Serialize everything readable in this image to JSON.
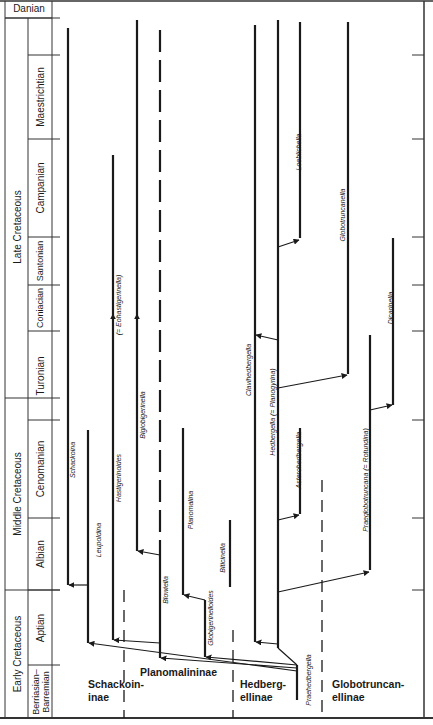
{
  "figure": {
    "caption_fragment": "Figure 5.105  Schematic evolutionary phylogeny of the planktonic Foraminifera"
  },
  "stratigraphy": {
    "top_label": "Danian",
    "epochs": [
      {
        "name": "Late Cretaceous",
        "y0": 55,
        "y1": 398
      },
      {
        "name": "Middle Cretaceous",
        "y0": 398,
        "y1": 590
      },
      {
        "name": "Early Cretaceous",
        "y0": 590,
        "y1": 718
      }
    ],
    "stages": [
      {
        "name": "Maestrichtian",
        "y0": 55,
        "y1": 139
      },
      {
        "name": "Campanian",
        "y0": 139,
        "y1": 237
      },
      {
        "name": "Santonian",
        "y0": 237,
        "y1": 285
      },
      {
        "name": "Coniacian",
        "y0": 285,
        "y1": 331
      },
      {
        "name": "Turonian",
        "y0": 331,
        "y1": 420
      },
      {
        "name": "Cenomanian",
        "y0": 420,
        "y1": 518
      },
      {
        "name": "Albian",
        "y0": 518,
        "y1": 590
      },
      {
        "name": "Aptian",
        "y0": 590,
        "y1": 665
      },
      {
        "name": "Berriasian–Barremian",
        "y0": 665,
        "y1": 718
      }
    ]
  },
  "subfamilies": [
    {
      "name": "Schackoin-\ninae",
      "x": 88,
      "y": 692
    },
    {
      "name": "Planomalininae",
      "x": 140,
      "y": 680
    },
    {
      "name": "Hedberg-\nellinae",
      "x": 240,
      "y": 692
    },
    {
      "name": "Globotruncan-\nellinae",
      "x": 332,
      "y": 692
    }
  ],
  "genera": [
    {
      "name": "Schackoina",
      "x": 72,
      "y": 460
    },
    {
      "name": "Leupoldina",
      "x": 98,
      "y": 540
    },
    {
      "name": "Hastigerinoides",
      "x": 118,
      "y": 478
    },
    {
      "name": "(= Eohastigerinella)",
      "x": 118,
      "y": 305
    },
    {
      "name": "Bigiobigerinella",
      "x": 142,
      "y": 415
    },
    {
      "name": "Blowiella",
      "x": 165,
      "y": 590
    },
    {
      "name": "Globigerinelloides",
      "x": 210,
      "y": 618
    },
    {
      "name": "Planomalina",
      "x": 190,
      "y": 510
    },
    {
      "name": "Biticinella",
      "x": 222,
      "y": 558
    },
    {
      "name": "Clavihedbergella",
      "x": 248,
      "y": 370
    },
    {
      "name": "Hedbergella (= Planogyrina)",
      "x": 272,
      "y": 412
    },
    {
      "name": "Asterohedbergella",
      "x": 298,
      "y": 460
    },
    {
      "name": "Loeblichella",
      "x": 298,
      "y": 152
    },
    {
      "name": "Globotruncanella",
      "x": 342,
      "y": 215
    },
    {
      "name": "Praeglobotruncana (= Rotundina)",
      "x": 365,
      "y": 480
    },
    {
      "name": "Dicarinella",
      "x": 390,
      "y": 308
    },
    {
      "name": "Praehedbergella",
      "x": 308,
      "y": 680
    }
  ],
  "right_axis_ticks": [
    55,
    139,
    237,
    285,
    331,
    420,
    518,
    590
  ]
}
